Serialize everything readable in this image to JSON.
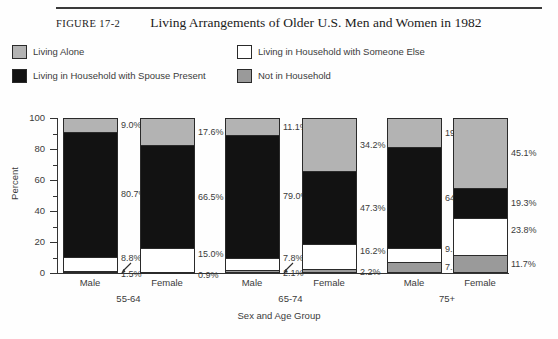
{
  "figure": {
    "number": "FIGURE 17-2",
    "title": "Living Arrangements of Older U.S. Men and Women in 1982"
  },
  "legend": {
    "items": [
      {
        "label": "Living Alone",
        "color": "#b3b3b3"
      },
      {
        "label": "Living in Household with Spouse Present",
        "color": "#121212"
      },
      {
        "label": "Living in Household with Someone Else",
        "color": "#ffffff"
      },
      {
        "label": "Not in Household",
        "color": "#9a9a9a"
      }
    ]
  },
  "chart_data": {
    "type": "bar",
    "subtype": "stacked-100",
    "title": "Living Arrangements of Older U.S. Men and Women in 1982",
    "xlabel": "Sex and Age Group",
    "ylabel": "Percent",
    "ylim": [
      0,
      100
    ],
    "yticks": [
      0,
      20,
      40,
      60,
      80,
      100
    ],
    "yticks_minor": [
      10,
      30,
      50,
      70,
      90
    ],
    "grid": false,
    "legend_position": "top",
    "categories": [
      "Male",
      "Female",
      "Male",
      "Female",
      "Male",
      "Female"
    ],
    "groups": [
      {
        "label": "55-64",
        "categories": [
          "Male",
          "Female"
        ]
      },
      {
        "label": "65-74",
        "categories": [
          "Male",
          "Female"
        ]
      },
      {
        "label": "75+",
        "categories": [
          "Male",
          "Female"
        ]
      }
    ],
    "series": [
      {
        "name": "Living Alone",
        "color": "#b3b3b3",
        "values": [
          9.0,
          17.6,
          11.1,
          34.2,
          19.0,
          45.1
        ]
      },
      {
        "name": "Living in Household with Spouse Present",
        "color": "#121212",
        "values": [
          80.7,
          66.5,
          79.0,
          47.3,
          64.8,
          19.3
        ]
      },
      {
        "name": "Living in Household with Someone Else",
        "color": "#ffffff",
        "values": [
          8.8,
          15.0,
          7.8,
          16.2,
          9.1,
          23.8
        ]
      },
      {
        "name": "Not in Household",
        "color": "#9a9a9a",
        "values": [
          1.5,
          0.9,
          2.1,
          2.2,
          7.1,
          11.7
        ]
      }
    ],
    "bars": [
      {
        "group": "55-64",
        "sex": "Male",
        "labels": [
          "9.0%",
          "80.7%",
          "8.8%",
          "1.5%"
        ]
      },
      {
        "group": "55-64",
        "sex": "Female",
        "labels": [
          "17.6%",
          "66.5%",
          "15.0%",
          "0.9%"
        ]
      },
      {
        "group": "65-74",
        "sex": "Male",
        "labels": [
          "11.1%",
          "79.0%",
          "7.8%",
          "2.1%"
        ]
      },
      {
        "group": "65-74",
        "sex": "Female",
        "labels": [
          "34.2%",
          "47.3%",
          "16.2%",
          "2.2%"
        ]
      },
      {
        "group": "75+",
        "sex": "Male",
        "labels": [
          "19.0%",
          "64.8%",
          "9.1%",
          "7.1%"
        ]
      },
      {
        "group": "75+",
        "sex": "Female",
        "labels": [
          "45.1%",
          "19.3%",
          "23.8%",
          "11.7%"
        ]
      }
    ]
  }
}
